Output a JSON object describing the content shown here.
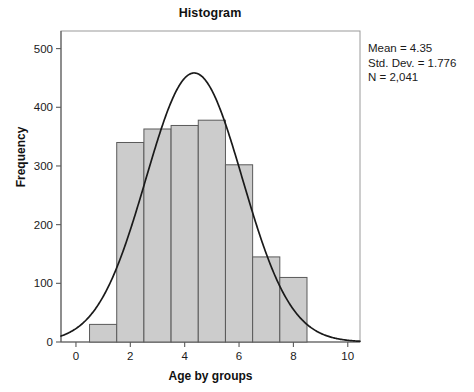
{
  "chart_data": {
    "type": "bar",
    "title": "Histogram",
    "xlabel": "Age by groups",
    "ylabel": "Frequency",
    "categories": [
      "1",
      "2",
      "3",
      "4",
      "5",
      "6",
      "7",
      "8"
    ],
    "bin_edges": [
      0.5,
      1.5,
      2.5,
      3.5,
      4.5,
      5.5,
      6.5,
      7.5,
      8.5
    ],
    "values": [
      30,
      340,
      363,
      369,
      378,
      302,
      145,
      110
    ],
    "xlim": [
      -0.55,
      10.45
    ],
    "ylim": [
      0,
      530
    ],
    "xticks": [
      0,
      2,
      4,
      6,
      8,
      10
    ],
    "yticks": [
      0,
      100,
      200,
      300,
      400,
      500
    ],
    "xtick_labels": [
      "0",
      "2",
      "4",
      "6",
      "8",
      "10"
    ],
    "ytick_labels": [
      "0",
      "100",
      "200",
      "300",
      "400",
      "500"
    ],
    "grid": false,
    "legend": "none",
    "bar_fill_color": "#cccccc",
    "bar_border_color": "#5a5a5a",
    "curve_color": "#1a1a1a",
    "frame_color": "#9a9a9a",
    "overlay_curve": {
      "type": "normal",
      "mean": 4.35,
      "std_dev": 1.776,
      "n": 2041,
      "bin_width": 1,
      "peak_value": 459
    }
  },
  "annotations": {
    "mean_label": "Mean = 4.35",
    "std_dev_label": "Std. Dev. = 1.776",
    "n_label": "N = 2,041"
  }
}
